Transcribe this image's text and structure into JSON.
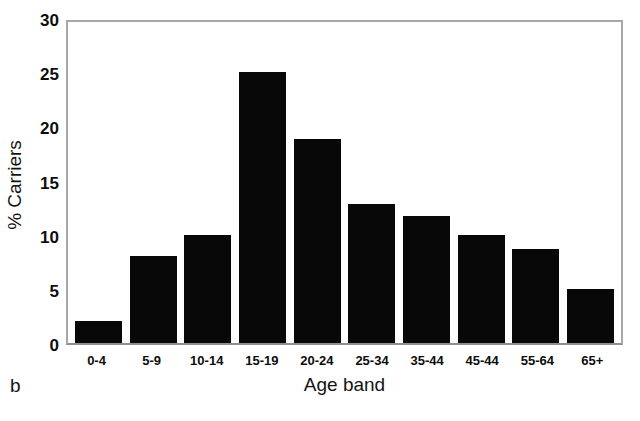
{
  "figure": {
    "panel_label": "b",
    "background_color": "#ffffff",
    "bar_color": "#080808",
    "frame_color": "#a8a8a8"
  },
  "chart_data": {
    "type": "bar",
    "title": "",
    "xlabel": "Age band",
    "ylabel": "% Carriers",
    "categories": [
      "0-4",
      "5-9",
      "10-14",
      "15-19",
      "20-24",
      "25-34",
      "35-44",
      "45-44",
      "55-64",
      "65+"
    ],
    "values": [
      2.0,
      8.0,
      10.0,
      25.0,
      18.8,
      12.8,
      11.7,
      10.0,
      8.7,
      5.0
    ],
    "ylim": [
      0,
      30
    ],
    "yticks": [
      30,
      25,
      20,
      15,
      10,
      5,
      0
    ],
    "ytick_labels": [
      "30",
      "25",
      "20",
      "15",
      "10",
      "5",
      "0"
    ],
    "grid": false,
    "legend": false,
    "legend_position": "none",
    "bar_color": "#080808"
  }
}
